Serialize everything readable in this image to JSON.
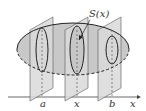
{
  "diagram": {
    "section_label": "S(x)",
    "axis_label": "x",
    "planes": [
      {
        "label": "a"
      },
      {
        "label": "x"
      },
      {
        "label": "b"
      }
    ],
    "colors": {
      "solid_fill": "#c8c8c8",
      "plane_fill": "#d9d9d9",
      "line": "#222222",
      "background": "#ffffff"
    }
  }
}
